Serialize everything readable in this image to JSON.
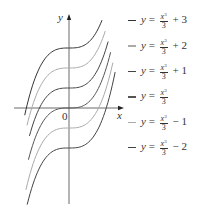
{
  "chart_data": {
    "type": "line",
    "title": "",
    "xlabel": "x",
    "ylabel": "y",
    "origin_label": "0",
    "xlim": [
      -2.6,
      2.6
    ],
    "ylim": [
      -4.9,
      4.7
    ],
    "grid": false,
    "legend_position": "right",
    "series": [
      {
        "name": "y = x^3/3 + 3",
        "offset": 3,
        "color": "#333333",
        "x_range": [
          -2.16,
          1.61
        ]
      },
      {
        "name": "y = x^3/3 + 2",
        "offset": 2,
        "color": "#aaaaaa",
        "x_range": [
          -2.05,
          1.77
        ]
      },
      {
        "name": "y = x^3/3 + 1",
        "offset": 1,
        "color": "#444444",
        "x_range": [
          -1.93,
          1.91
        ]
      },
      {
        "name": "y = x^3/3",
        "offset": 0,
        "color": "#555555",
        "x_range": [
          -1.98,
          2.03
        ]
      },
      {
        "name": "y = x^3/3 - 1",
        "offset": -1,
        "color": "#aaaaaa",
        "x_range": [
          -2.1,
          2.14
        ]
      },
      {
        "name": "y = x^3/3 - 2",
        "offset": -2,
        "color": "#444444",
        "x_range": [
          -2.04,
          2.25
        ]
      }
    ]
  },
  "legend": [
    {
      "prefix": "y",
      "suffix": "+ 3"
    },
    {
      "prefix": "y",
      "suffix": "+ 2"
    },
    {
      "prefix": "y",
      "suffix": "+ 1"
    },
    {
      "prefix": "y",
      "suffix": ""
    },
    {
      "prefix": "y",
      "suffix": "− 1"
    },
    {
      "prefix": "y",
      "suffix": "− 2"
    }
  ],
  "fraction": {
    "num": "x",
    "exp": "3",
    "den": "3"
  }
}
